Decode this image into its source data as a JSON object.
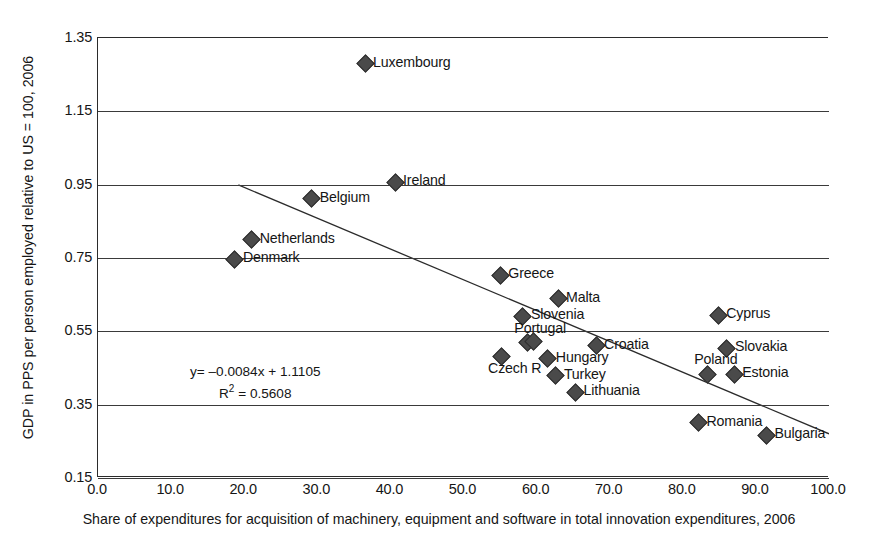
{
  "chart_data": {
    "type": "scatter",
    "title": "",
    "xlabel": "Share of expenditures for acquisition of machinery, equipment and software in total innovation expenditures, 2006",
    "ylabel": "GDP in PPS per person employed relative to US = 100, 2006",
    "xlim": [
      0.0,
      100.0
    ],
    "ylim": [
      0.15,
      1.35
    ],
    "xticks": [
      "0.0",
      "10.0",
      "20.0",
      "30.0",
      "40.0",
      "50.0",
      "60.0",
      "70.0",
      "80.0",
      "90.0",
      "100.0"
    ],
    "xtick_values": [
      0,
      10,
      20,
      30,
      40,
      50,
      60,
      70,
      80,
      90,
      100
    ],
    "yticks": [
      "1.35",
      "1.15",
      "0.95",
      "0.75",
      "0.55",
      "0.35",
      "0.15"
    ],
    "ytick_values": [
      1.35,
      1.15,
      0.95,
      0.75,
      0.55,
      0.35,
      0.15
    ],
    "grid": true,
    "legend": "none",
    "marker": "diamond",
    "marker_color": "#4a4a4a",
    "points": [
      {
        "label": "Luxembourg",
        "x": 36.4,
        "y": 1.283,
        "label_pos": "right"
      },
      {
        "label": "Ireland",
        "x": 40.5,
        "y": 0.96,
        "label_pos": "right"
      },
      {
        "label": "Belgium",
        "x": 29.1,
        "y": 0.914,
        "label_pos": "right"
      },
      {
        "label": "Netherlands",
        "x": 20.9,
        "y": 0.802,
        "label_pos": "right"
      },
      {
        "label": "Denmark",
        "x": 18.6,
        "y": 0.75,
        "label_pos": "right"
      },
      {
        "label": "Greece",
        "x": 54.9,
        "y": 0.706,
        "label_pos": "right"
      },
      {
        "label": "Malta",
        "x": 62.8,
        "y": 0.641,
        "label_pos": "right"
      },
      {
        "label": "Slovenia",
        "x": 58.0,
        "y": 0.594,
        "label_pos": "right"
      },
      {
        "label": "Cyprus",
        "x": 84.7,
        "y": 0.597,
        "label_pos": "right"
      },
      {
        "label": "Portugal",
        "x": 58.6,
        "y": 0.521,
        "label_pos": "above"
      },
      {
        "label": "",
        "x": 59.5,
        "y": 0.525,
        "label_pos": "right"
      },
      {
        "label": "Croatia",
        "x": 68.0,
        "y": 0.514,
        "label_pos": "right"
      },
      {
        "label": "Slovakia",
        "x": 85.9,
        "y": 0.507,
        "label_pos": "right"
      },
      {
        "label": "Czech R",
        "x": 55.0,
        "y": 0.485,
        "label_pos": "below"
      },
      {
        "label": "Hungary",
        "x": 61.4,
        "y": 0.478,
        "label_pos": "right"
      },
      {
        "label": "Poland",
        "x": 83.2,
        "y": 0.436,
        "label_pos": "above"
      },
      {
        "label": "Estonia",
        "x": 86.9,
        "y": 0.436,
        "label_pos": "right"
      },
      {
        "label": "Turkey",
        "x": 62.5,
        "y": 0.431,
        "label_pos": "right"
      },
      {
        "label": "Lithuania",
        "x": 65.2,
        "y": 0.386,
        "label_pos": "right"
      },
      {
        "label": "Romania",
        "x": 82.0,
        "y": 0.303,
        "label_pos": "right"
      },
      {
        "label": "Bulgaria",
        "x": 91.3,
        "y": 0.27,
        "label_pos": "right"
      }
    ],
    "trendline": {
      "equation_line1": "y= –0.0084x + 1.1105",
      "equation_r2_prefix": "R",
      "equation_r2_sup": "2",
      "equation_r2_suffix": " = 0.5608",
      "slope": -0.0084,
      "intercept": 1.1105,
      "r_squared": 0.5608,
      "x_start": 19.2,
      "x_end": 100.0
    }
  }
}
